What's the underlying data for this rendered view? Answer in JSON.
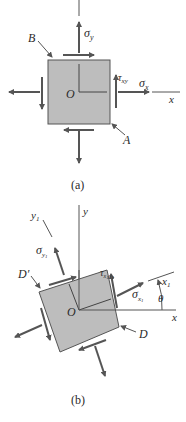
{
  "figure_a": {
    "caption": "(a)",
    "labels": {
      "sigma_y": "σ",
      "sigma_y_sub": "y",
      "sigma_x": "σ",
      "sigma_x_sub": "x",
      "tau_xy": "τ",
      "tau_xy_sub": "xy",
      "origin": "O",
      "x_axis": "x",
      "point_A": "A",
      "point_B": "B"
    }
  },
  "figure_b": {
    "caption": "(b)",
    "labels": {
      "y_axis": "y",
      "y1_axis": "y",
      "y1_axis_sub": "1",
      "x_axis": "x",
      "x1_axis": "x",
      "x1_axis_sub": "1",
      "sigma_y1": "σ",
      "sigma_y1_sub": "y",
      "sigma_y1_subsub": "1",
      "sigma_x1": "σ",
      "sigma_x1_sub": "x",
      "sigma_x1_subsub": "1",
      "tau_x1y1": "τ",
      "tau_x1y1_sub": "x",
      "tau_x1y1_sub2": "1",
      "tau_x1y1_sub3": "y",
      "tau_x1y1_sub4": "1",
      "theta": "θ",
      "origin": "O",
      "point_D": "D",
      "point_D_prime": "D′"
    }
  },
  "colors": {
    "element_fill": "#bdbdbd",
    "line": "#555555",
    "text": "#2a2a2a"
  }
}
